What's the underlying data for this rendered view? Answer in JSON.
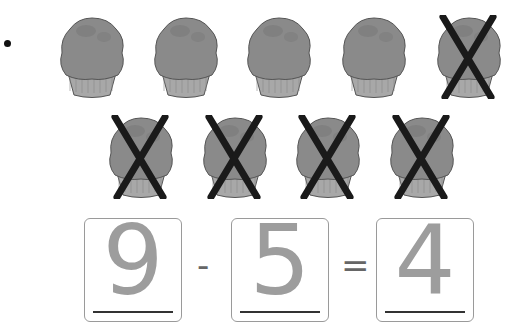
{
  "problem": {
    "bullet": "•",
    "total_items": 9,
    "crossed_out": 5,
    "item_type": "muffin",
    "rows": [
      {
        "muffins": [
          {
            "crossed": false,
            "x": 54,
            "y": 15
          },
          {
            "crossed": false,
            "x": 148,
            "y": 15
          },
          {
            "crossed": false,
            "x": 241,
            "y": 15
          },
          {
            "crossed": false,
            "x": 336,
            "y": 15
          },
          {
            "crossed": true,
            "x": 431,
            "y": 15
          }
        ]
      },
      {
        "muffins": [
          {
            "crossed": true,
            "x": 103,
            "y": 115
          },
          {
            "crossed": true,
            "x": 197,
            "y": 115
          },
          {
            "crossed": true,
            "x": 290,
            "y": 115
          },
          {
            "crossed": true,
            "x": 384,
            "y": 115
          }
        ]
      }
    ]
  },
  "equation": {
    "minuend": "9",
    "operator": "-",
    "subtrahend": "5",
    "equals": "=",
    "difference": "4"
  },
  "colors": {
    "muffin_top": "#8a8a8a",
    "muffin_wrapper": "#a8a8a8",
    "muffin_outline": "#555555",
    "cross": "#1a1a1a",
    "handwriting": "#8c8c8c",
    "box_border": "#9a9a9a"
  }
}
